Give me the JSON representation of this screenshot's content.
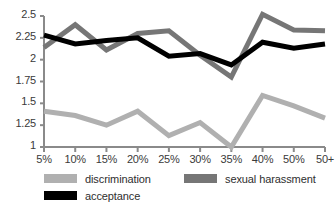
{
  "chart_data": {
    "type": "line",
    "title": "",
    "subtitle": "",
    "xlabel": "",
    "ylabel": "",
    "categories": [
      "5%",
      "10%",
      "15%",
      "20%",
      "25%",
      "30%",
      "35%",
      "40%",
      "50%",
      "50+"
    ],
    "x_tick_labels": [
      "5%",
      "10%",
      "15%",
      "20%",
      "25%",
      "30%",
      "35%",
      "40%",
      "50%",
      "50+"
    ],
    "y_tick_labels": [
      "1",
      "1.25",
      "1.5",
      "1.75",
      "2",
      "2.25",
      "2.5"
    ],
    "y_tick_values": [
      1,
      1.25,
      1.5,
      1.75,
      2,
      2.25,
      2.5
    ],
    "ylim": [
      1,
      2.5
    ],
    "grid": false,
    "legend_position": "bottom",
    "series": [
      {
        "name": "discrimination",
        "color": "#b0b0b0",
        "values": [
          1.41,
          1.36,
          1.25,
          1.41,
          1.13,
          1.28,
          1.0,
          1.59,
          1.47,
          1.33
        ]
      },
      {
        "name": "sexual harassment",
        "color": "#767676",
        "values": [
          2.14,
          2.4,
          2.11,
          2.3,
          2.33,
          2.05,
          1.8,
          2.52,
          2.34,
          2.33
        ]
      },
      {
        "name": "acceptance",
        "color": "#000000",
        "values": [
          2.28,
          2.18,
          2.22,
          2.25,
          2.04,
          2.07,
          1.94,
          2.2,
          2.13,
          2.18
        ]
      }
    ]
  },
  "legend": {
    "items": [
      {
        "label": "discrimination",
        "color": "#b0b0b0"
      },
      {
        "label": "sexual harassment",
        "color": "#767676"
      },
      {
        "label": "acceptance",
        "color": "#000000"
      }
    ]
  },
  "axes": {
    "axis_color": "#8a8a8a"
  }
}
